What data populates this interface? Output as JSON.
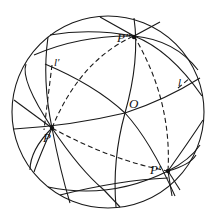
{
  "figure": {
    "type": "sphere-diagram",
    "labels": {
      "P_double_prime": "P″",
      "l_prime": "l′",
      "l": "l",
      "O": "O",
      "P": "P",
      "P_prime": "P′"
    },
    "colors": {
      "stroke": "#1a1a1a",
      "background": "#ffffff"
    }
  }
}
